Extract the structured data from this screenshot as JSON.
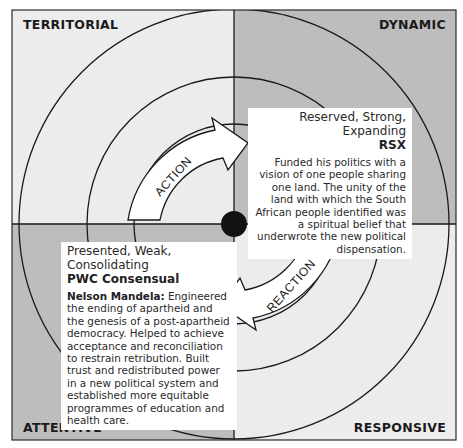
{
  "diagram": {
    "quadrants": [
      {
        "position": "top-left",
        "label": "TERRITORIAL",
        "fill": "#ececec"
      },
      {
        "position": "top-right",
        "label": "DYNAMIC",
        "fill": "#bdbdbd"
      },
      {
        "position": "bottom-left",
        "label": "ATTENTIVE",
        "fill": "#bdbdbd"
      },
      {
        "position": "bottom-right",
        "label": "RESPONSIVE",
        "fill": "#ececec"
      }
    ],
    "arrows": [
      {
        "label": "ACTION",
        "direction": "clockwise toward top-right"
      },
      {
        "label": "REACTION",
        "direction": "clockwise toward bottom-left"
      }
    ],
    "rsx_box": {
      "heading": "Reserved, Strong, Expanding",
      "code": "RSX",
      "body": "Funded his politics with a vision of one people sharing one land. The unity of the land with which the South African people identified was a spiritual belief that underwrote the new political dispensation."
    },
    "pwc_box": {
      "heading": "Presented, Weak, Consolidating",
      "code": "PWC Consensual",
      "name": "Nelson Mandela:",
      "body": " Engineered the ending of apartheid and the genesis of a post-apartheid democracy. Helped to achieve acceptance and reconciliation to restrain retribution. Built trust and redistributed power in a new political system and established more equitable programmes of education and health care."
    },
    "colors": {
      "light_quadrant": "#ececec",
      "dark_quadrant": "#bdbdbd",
      "line": "#1a1a1a",
      "center_dot": "#111111"
    }
  }
}
